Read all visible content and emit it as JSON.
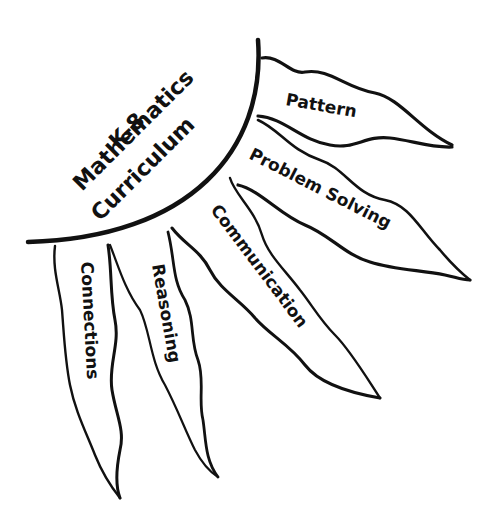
{
  "diagram": {
    "title_lines": [
      "K-8",
      "Mathematics",
      "Curriculum"
    ],
    "banners": [
      {
        "id": "pattern",
        "label": "Pattern"
      },
      {
        "id": "problem-solving",
        "label": "Problem Solving"
      },
      {
        "id": "communication",
        "label": "Communication"
      },
      {
        "id": "reasoning",
        "label": "Reasoning"
      },
      {
        "id": "connections",
        "label": "Connections"
      }
    ],
    "colors": {
      "ink": "#111111",
      "background": "#ffffff"
    }
  }
}
